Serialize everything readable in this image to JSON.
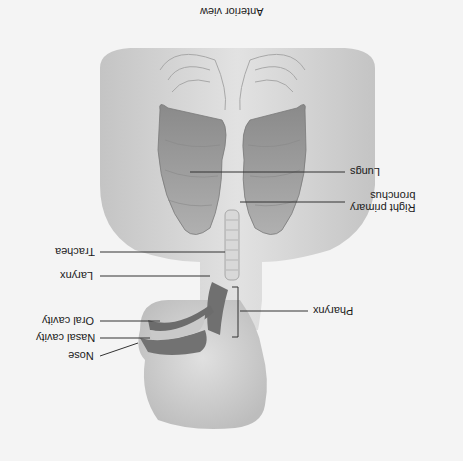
{
  "diagram": {
    "title": "Anterior view",
    "orientation": "rotated 180 degrees",
    "labels": [
      {
        "id": "lungs",
        "text": "Lungs"
      },
      {
        "id": "right-primary-bronchus",
        "text": "Right primary\nbronchus"
      },
      {
        "id": "trachea",
        "text": "Trachea"
      },
      {
        "id": "larynx",
        "text": "Larynx"
      },
      {
        "id": "pharynx",
        "text": "Pharynx"
      },
      {
        "id": "oral-cavity",
        "text": "Oral cavity"
      },
      {
        "id": "nasal-cavity",
        "text": "Nasal cavity"
      },
      {
        "id": "nose",
        "text": "Nose"
      }
    ],
    "colors": {
      "background": "#f4f4f4",
      "body": "#d6d6d6",
      "lung": "#9a9a9a",
      "cavity": "#6e6e6e",
      "leader_line": "#333333"
    }
  }
}
